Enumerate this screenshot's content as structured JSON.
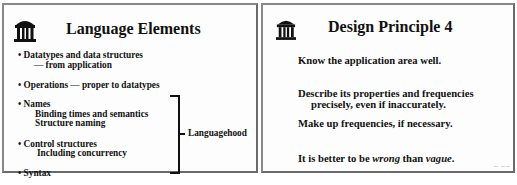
{
  "slides": [
    {
      "title": "Language Elements",
      "logo_icon": "old-well-icon",
      "items": [
        {
          "text": "• Datatypes and data structures"
        },
        {
          "text": "— from application"
        },
        {
          "text": "• Operations — proper to datatypes"
        },
        {
          "text": "• Names"
        },
        {
          "text": "Binding times and semantics"
        },
        {
          "text": "Structure naming"
        },
        {
          "text": "• Control structures"
        },
        {
          "text": "Including concurrency"
        },
        {
          "text": "• Syntax"
        }
      ],
      "bracket_label": "Languagehood"
    },
    {
      "title": "Design Principle 4",
      "logo_icon": "old-well-icon",
      "items": [
        {
          "text": "Know the application area well."
        },
        {
          "text": "Describe its properties and frequencies"
        },
        {
          "text": "precisely,  even if inaccurately."
        },
        {
          "text": "Make up frequencies, if necessary."
        }
      ],
      "last_line": {
        "part1": "It is better to be ",
        "em1": "wrong",
        "part2": " than ",
        "em2": "vague",
        "part3": "."
      },
      "corner_mark": "— ——"
    }
  ],
  "colors": {
    "border": "#6a6a6a",
    "text": "#111111",
    "background": "#fdfdfd"
  }
}
